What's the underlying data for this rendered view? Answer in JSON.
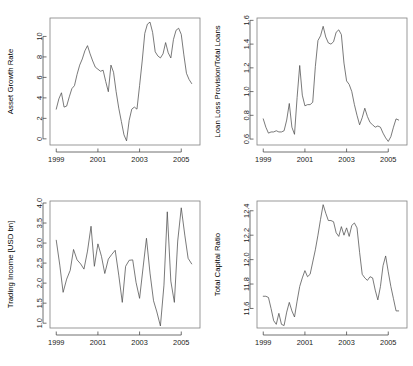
{
  "figure": {
    "title": "",
    "layout": "2x2 grid of time series line plots",
    "background_color": "#ffffff",
    "line_color": "#4d4d4d",
    "axis_color": "#808080"
  },
  "chart_data": [
    {
      "type": "line",
      "panel": "top-left",
      "title": "",
      "xlabel": "",
      "ylabel": "Asset Growth Rate",
      "xlim": [
        1998.7,
        2005.9
      ],
      "ylim": [
        -0.6,
        11.8
      ],
      "xticks": [
        1999,
        2001,
        2003,
        2005
      ],
      "xtick_labels": [
        "1999",
        "2001",
        "2003",
        "2005"
      ],
      "yticks": [
        0,
        2,
        4,
        6,
        8,
        10
      ],
      "ytick_labels": [
        "0",
        "2",
        "4",
        "6",
        "8",
        "10"
      ],
      "grid": false,
      "legend": null,
      "x": [
        1999.0,
        1999.125,
        1999.25,
        1999.375,
        1999.5,
        1999.625,
        1999.75,
        1999.875,
        2000.0,
        2000.125,
        2000.25,
        2000.375,
        2000.5,
        2000.625,
        2000.75,
        2000.875,
        2001.0,
        2001.125,
        2001.25,
        2001.375,
        2001.5,
        2001.625,
        2001.75,
        2001.875,
        2002.0,
        2002.125,
        2002.25,
        2002.375,
        2002.5,
        2002.625,
        2002.75,
        2002.875,
        2003.0,
        2003.125,
        2003.25,
        2003.375,
        2003.5,
        2003.625,
        2003.75,
        2003.875,
        2004.0,
        2004.125,
        2004.25,
        2004.375,
        2004.5,
        2004.625,
        2004.75,
        2004.875,
        2005.0,
        2005.125,
        2005.25,
        2005.375,
        2005.5
      ],
      "y": [
        2.9,
        3.9,
        4.5,
        3.1,
        3.2,
        4.1,
        4.9,
        5.2,
        6.3,
        7.2,
        7.8,
        8.6,
        9.1,
        8.3,
        7.6,
        7.0,
        6.8,
        6.6,
        6.7,
        5.6,
        4.6,
        7.2,
        6.5,
        4.6,
        3.0,
        1.7,
        0.4,
        -0.2,
        1.8,
        2.9,
        3.1,
        2.9,
        5.2,
        7.6,
        10.3,
        11.2,
        11.4,
        10.4,
        8.5,
        8.1,
        7.9,
        8.3,
        9.4,
        8.4,
        7.9,
        9.7,
        10.6,
        10.8,
        10.2,
        8.2,
        6.4,
        5.8,
        5.4
      ]
    },
    {
      "type": "line",
      "panel": "top-right",
      "title": "",
      "xlabel": "",
      "ylabel": "Loan Loss Provision/Total Loans",
      "xlim": [
        1998.7,
        2005.9
      ],
      "ylim": [
        0.55,
        1.62
      ],
      "xticks": [
        1999,
        2001,
        2003,
        2005
      ],
      "xtick_labels": [
        "1999",
        "2001",
        "2003",
        "2005"
      ],
      "yticks": [
        0.6,
        0.8,
        1.0,
        1.2,
        1.4,
        1.6
      ],
      "ytick_labels": [
        "0.6",
        "0.8",
        "1.0",
        "1.2",
        "1.4",
        "1.6"
      ],
      "grid": false,
      "legend": null,
      "x": [
        1999.0,
        1999.125,
        1999.25,
        1999.375,
        1999.5,
        1999.625,
        1999.75,
        1999.875,
        2000.0,
        2000.125,
        2000.25,
        2000.375,
        2000.5,
        2000.625,
        2000.75,
        2000.875,
        2001.0,
        2001.125,
        2001.25,
        2001.375,
        2001.5,
        2001.625,
        2001.75,
        2001.875,
        2002.0,
        2002.125,
        2002.25,
        2002.375,
        2002.5,
        2002.625,
        2002.75,
        2002.875,
        2003.0,
        2003.125,
        2003.25,
        2003.375,
        2003.5,
        2003.625,
        2003.75,
        2003.875,
        2004.0,
        2004.125,
        2004.25,
        2004.375,
        2004.5,
        2004.625,
        2004.75,
        2004.875,
        2005.0,
        2005.125,
        2005.25,
        2005.375,
        2005.5
      ],
      "y": [
        0.77,
        0.7,
        0.65,
        0.66,
        0.66,
        0.67,
        0.66,
        0.66,
        0.67,
        0.76,
        0.9,
        0.7,
        0.64,
        0.95,
        1.22,
        0.97,
        0.88,
        0.89,
        0.89,
        0.91,
        1.21,
        1.43,
        1.47,
        1.55,
        1.46,
        1.41,
        1.4,
        1.42,
        1.5,
        1.52,
        1.48,
        1.24,
        1.09,
        1.06,
        1.0,
        0.89,
        0.8,
        0.72,
        0.78,
        0.86,
        0.79,
        0.74,
        0.72,
        0.7,
        0.71,
        0.7,
        0.65,
        0.61,
        0.58,
        0.62,
        0.7,
        0.77,
        0.76
      ]
    },
    {
      "type": "line",
      "panel": "bottom-left",
      "title": "",
      "xlabel": "",
      "ylabel": "Trading Income [USD bn]",
      "xlim": [
        1998.7,
        2005.9
      ],
      "ylim": [
        0.88,
        4.05
      ],
      "xticks": [
        1999,
        2001,
        2003,
        2005
      ],
      "xtick_labels": [
        "1999",
        "2001",
        "2003",
        "2005"
      ],
      "yticks": [
        1.0,
        1.5,
        2.0,
        2.5,
        3.0,
        3.5,
        4.0
      ],
      "ytick_labels": [
        "1.0",
        "1.5",
        "2.0",
        "2.5",
        "3.0",
        "3.5",
        "4.0"
      ],
      "grid": false,
      "legend": null,
      "x": [
        1999.0,
        1999.17,
        1999.33,
        1999.5,
        1999.67,
        1999.83,
        2000.0,
        2000.17,
        2000.33,
        2000.5,
        2000.67,
        2000.83,
        2001.0,
        2001.17,
        2001.33,
        2001.5,
        2001.67,
        2001.83,
        2002.0,
        2002.17,
        2002.33,
        2002.5,
        2002.67,
        2002.83,
        2003.0,
        2003.17,
        2003.33,
        2003.5,
        2003.67,
        2003.83,
        2004.0,
        2004.17,
        2004.33,
        2004.5,
        2004.67,
        2004.83,
        2005.0,
        2005.17,
        2005.33,
        2005.5
      ],
      "y": [
        3.07,
        2.45,
        1.77,
        2.1,
        2.32,
        2.84,
        2.58,
        2.48,
        2.35,
        2.8,
        3.42,
        2.42,
        2.98,
        2.67,
        2.24,
        2.6,
        2.72,
        2.82,
        2.2,
        1.52,
        2.42,
        2.57,
        2.58,
        2.02,
        1.62,
        2.4,
        3.12,
        2.25,
        1.56,
        1.28,
        0.93,
        1.95,
        3.78,
        2.05,
        1.52,
        3.05,
        3.88,
        3.2,
        2.62,
        2.48
      ]
    },
    {
      "type": "line",
      "panel": "bottom-right",
      "title": "",
      "xlabel": "",
      "ylabel": "Total Capital Ratio",
      "xlim": [
        1998.7,
        2005.9
      ],
      "ylim": [
        11.44,
        12.48
      ],
      "xticks": [
        1999,
        2001,
        2003,
        2005
      ],
      "xtick_labels": [
        "1999",
        "2001",
        "2003",
        "2005"
      ],
      "yticks": [
        11.6,
        11.8,
        12.0,
        12.2,
        12.4
      ],
      "ytick_labels": [
        "11.6",
        "11.8",
        "12.0",
        "12.2",
        "12.4"
      ],
      "grid": false,
      "legend": null,
      "x": [
        1999.0,
        1999.125,
        1999.25,
        1999.375,
        1999.5,
        1999.625,
        1999.75,
        1999.875,
        2000.0,
        2000.125,
        2000.25,
        2000.375,
        2000.5,
        2000.625,
        2000.75,
        2000.875,
        2001.0,
        2001.125,
        2001.25,
        2001.375,
        2001.5,
        2001.625,
        2001.75,
        2001.875,
        2002.0,
        2002.125,
        2002.25,
        2002.375,
        2002.5,
        2002.625,
        2002.75,
        2002.875,
        2003.0,
        2003.125,
        2003.25,
        2003.375,
        2003.5,
        2003.625,
        2003.75,
        2003.875,
        2004.0,
        2004.125,
        2004.25,
        2004.375,
        2004.5,
        2004.625,
        2004.75,
        2004.875,
        2005.0,
        2005.125,
        2005.25,
        2005.375,
        2005.5
      ],
      "y": [
        11.7,
        11.7,
        11.69,
        11.6,
        11.5,
        11.47,
        11.56,
        11.47,
        11.46,
        11.57,
        11.65,
        11.58,
        11.53,
        11.66,
        11.78,
        11.85,
        11.91,
        11.86,
        11.88,
        11.98,
        12.08,
        12.2,
        12.33,
        12.45,
        12.38,
        12.32,
        12.32,
        12.31,
        12.22,
        12.19,
        12.27,
        12.2,
        12.26,
        12.19,
        12.28,
        12.3,
        12.26,
        12.06,
        11.88,
        11.85,
        11.83,
        11.86,
        11.85,
        11.75,
        11.67,
        11.78,
        11.95,
        12.03,
        11.9,
        11.78,
        11.68,
        11.58,
        11.58
      ]
    }
  ]
}
